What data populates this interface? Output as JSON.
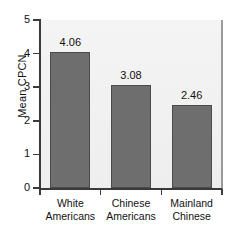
{
  "chart_data": {
    "type": "bar",
    "title": "",
    "xlabel": "",
    "ylabel": "Mean CPCN",
    "categories": [
      "White Americans",
      "Chinese Americans",
      "Mainland Chinese"
    ],
    "category_lines": [
      [
        "White",
        "Americans"
      ],
      [
        "Chinese",
        "Americans"
      ],
      [
        "Mainland",
        "Chinese"
      ]
    ],
    "values": [
      4.06,
      3.08,
      2.46
    ],
    "value_labels": [
      "4.06",
      "3.08",
      "2.46"
    ],
    "ylim": [
      0,
      5
    ],
    "ytick_labels": [
      "0",
      "1",
      "2",
      "3",
      "4",
      "5"
    ],
    "ytick_values": [
      0,
      1,
      2,
      3,
      4,
      5
    ],
    "grid": false,
    "legend": null,
    "bar_color": "#6e6e6e",
    "bar_edge_color": "#4a4a4a",
    "panel_background": "#f1f1f1",
    "axis_color": "#3a3a3a"
  }
}
